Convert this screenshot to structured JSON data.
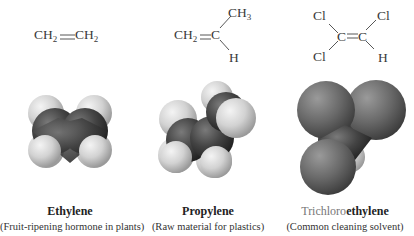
{
  "molecules": [
    {
      "name": "Ethylene",
      "description": "(Fruit-ripening hormone in plants)",
      "formula": {
        "left": {
          "main": "CH",
          "sub": "2"
        },
        "bond": "=",
        "right": {
          "main": "CH",
          "sub": "2"
        }
      }
    },
    {
      "name": "Propylene",
      "description": "(Raw material for plastics)",
      "formula": {
        "left": {
          "main": "CH",
          "sub": "2"
        },
        "bond": "=",
        "center": "C",
        "upper_right": {
          "main": "CH",
          "sub": "3"
        },
        "lower_right": "H"
      }
    },
    {
      "name_prefix": "Trichloro",
      "name_suffix": "ethylene",
      "description": "(Common cleaning solvent)",
      "formula": {
        "upper_left": "Cl",
        "lower_left": "Cl",
        "left_c": "C",
        "bond": "=",
        "right_c": "C",
        "upper_right": "Cl",
        "lower_right": "H"
      }
    }
  ],
  "colors": {
    "carbon": "#3c3c3c",
    "hydrogen": "#d6d6d6",
    "chlorine": "#6e6e6e",
    "text": "#333333"
  }
}
